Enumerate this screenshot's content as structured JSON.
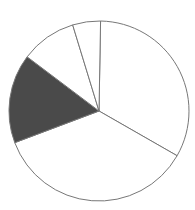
{
  "chart_data": {
    "type": "pie",
    "title": "",
    "categories": [
      "A",
      "B",
      "C",
      "D",
      "E"
    ],
    "values": [
      33,
      36,
      16,
      10,
      5
    ],
    "start_angle_deg": 1,
    "fills": [
      "#ffffff",
      "#ffffff",
      "#4a4a4a",
      "#ffffff",
      "#ffffff"
    ],
    "stroke": "#777777",
    "center": [
      99,
      111
    ],
    "radius": 90
  }
}
